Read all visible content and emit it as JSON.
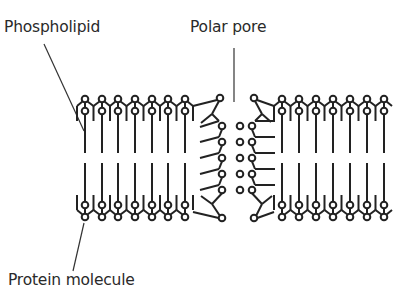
{
  "diagram": {
    "type": "cell-membrane-bilayer",
    "labels": {
      "phospholipid": "Phospholipid",
      "polar_pore": "Polar pore",
      "protein_molecule": "Protein molecule"
    },
    "colors": {
      "stroke": "#222222",
      "text": "#2a2a2a",
      "background": "#ffffff"
    },
    "left_columns": [
      85,
      102,
      118,
      135,
      152,
      168,
      185
    ],
    "right_columns": [
      282,
      299,
      316,
      333,
      350,
      367,
      384
    ]
  }
}
